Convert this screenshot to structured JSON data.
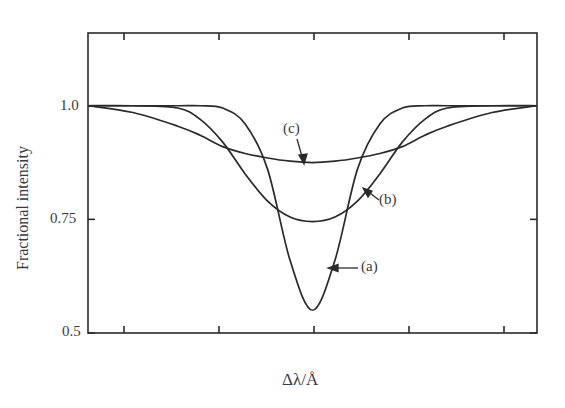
{
  "chart_data": {
    "type": "line",
    "title": "",
    "xlabel": "Δλ/Å",
    "ylabel": "Fractional intensity",
    "ylim": [
      0.5,
      1.16
    ],
    "yticks": [
      0.5,
      0.75,
      1.0
    ],
    "ytick_labels": [
      "0.5",
      "0.75",
      "1.0"
    ],
    "x_ticks_count": 5,
    "x_tick_labels": [],
    "grid": false,
    "legend": "inline annotations with arrows",
    "x": [
      -1.0,
      -0.8,
      -0.6,
      -0.5,
      -0.4,
      -0.3,
      -0.2,
      -0.1,
      0.0,
      0.1,
      0.2,
      0.3,
      0.4,
      0.5,
      0.6,
      0.8,
      1.0
    ],
    "series": [
      {
        "name": "(a)",
        "values": [
          1.0,
          1.0,
          1.0,
          1.0,
          0.995,
          0.96,
          0.86,
          0.66,
          0.55,
          0.66,
          0.86,
          0.96,
          0.995,
          1.0,
          1.0,
          1.0,
          1.0
        ]
      },
      {
        "name": "(b)",
        "values": [
          1.0,
          1.0,
          0.995,
          0.97,
          0.92,
          0.85,
          0.79,
          0.755,
          0.745,
          0.755,
          0.79,
          0.85,
          0.92,
          0.97,
          0.995,
          1.0,
          1.0
        ]
      },
      {
        "name": "(c)",
        "values": [
          1.0,
          0.985,
          0.955,
          0.935,
          0.91,
          0.895,
          0.885,
          0.878,
          0.875,
          0.878,
          0.885,
          0.895,
          0.91,
          0.935,
          0.955,
          0.985,
          1.0
        ]
      }
    ],
    "annotations": [
      "(a)",
      "(b)",
      "(c)"
    ]
  },
  "labels": {
    "y_axis": "Fractional intensity",
    "x_axis": "Δλ/Å",
    "tick_1_0": "1.0",
    "tick_0_75": "0.75",
    "tick_0_5": "0.5",
    "curve_a": "(a)",
    "curve_b": "(b)",
    "curve_c": "(c)"
  },
  "colors": {
    "line": "#2a2a2a",
    "background": "#ffffff"
  }
}
